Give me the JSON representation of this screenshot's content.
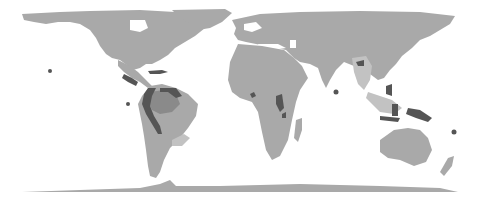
{
  "map": {
    "type": "world-choropleth",
    "projection": "equirectangular",
    "colors": {
      "background": "#ffffff",
      "land": "#a9a9a9",
      "light_highlight": "#c2c2c2",
      "medium_highlight": "#8a8a8a",
      "dark_highlight": "#555555"
    },
    "highlighted_regions": [
      {
        "name": "Tropical Andes",
        "shade": "dark"
      },
      {
        "name": "Amazon Basin",
        "shade": "medium"
      },
      {
        "name": "Mesoamerica",
        "shade": "dark"
      },
      {
        "name": "Caribbean",
        "shade": "dark"
      },
      {
        "name": "Atlantic Forest",
        "shade": "light"
      },
      {
        "name": "Galapagos",
        "shade": "dark"
      },
      {
        "name": "Hawaii",
        "shade": "dark"
      },
      {
        "name": "Albertine Rift",
        "shade": "dark"
      },
      {
        "name": "Cameroon Highlands",
        "shade": "dark"
      },
      {
        "name": "Sri Lanka",
        "shade": "dark"
      },
      {
        "name": "Indo-Burma",
        "shade": "light"
      },
      {
        "name": "Philippines",
        "shade": "dark"
      },
      {
        "name": "Sulawesi",
        "shade": "dark"
      },
      {
        "name": "New Guinea",
        "shade": "dark"
      },
      {
        "name": "Sundaland",
        "shade": "light"
      },
      {
        "name": "Fiji",
        "shade": "dark"
      }
    ]
  }
}
